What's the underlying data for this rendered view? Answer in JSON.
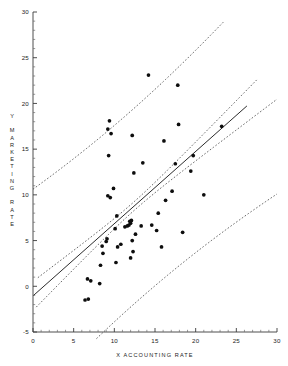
{
  "chart_data": {
    "type": "scatter",
    "title": "",
    "xlabel": "X ACCOUNTING RATE",
    "ylabel": "Y MARKETING RATE",
    "xlim": [
      0,
      30
    ],
    "ylim": [
      -5,
      30
    ],
    "xticks": [
      0,
      5,
      10,
      15,
      20,
      25,
      30
    ],
    "yticks": [
      -5,
      0,
      5,
      10,
      15,
      20,
      25,
      30
    ],
    "xtick_labels": [
      "0",
      "5",
      "10",
      "15",
      "20",
      "25",
      "30"
    ],
    "ytick_labels": [
      "-5",
      "0",
      "5",
      "10",
      "15",
      "20",
      "25",
      "30"
    ],
    "grid": false,
    "legend": "none",
    "minor_ticks": true,
    "points": [
      [
        6.4,
        -1.5
      ],
      [
        6.8,
        -1.4
      ],
      [
        6.7,
        0.8
      ],
      [
        7.1,
        0.6
      ],
      [
        8.2,
        0.3
      ],
      [
        8.3,
        2.3
      ],
      [
        8.6,
        3.6
      ],
      [
        8.5,
        4.4
      ],
      [
        9.0,
        4.9
      ],
      [
        9.1,
        5.2
      ],
      [
        9.2,
        9.9
      ],
      [
        9.5,
        9.7
      ],
      [
        9.3,
        14.3
      ],
      [
        9.2,
        17.2
      ],
      [
        9.4,
        18.1
      ],
      [
        9.6,
        16.7
      ],
      [
        9.9,
        10.7
      ],
      [
        10.1,
        6.3
      ],
      [
        10.3,
        7.7
      ],
      [
        10.2,
        2.6
      ],
      [
        10.4,
        4.3
      ],
      [
        10.8,
        4.6
      ],
      [
        11.3,
        6.5
      ],
      [
        11.6,
        6.6
      ],
      [
        11.8,
        6.7
      ],
      [
        11.9,
        7.1
      ],
      [
        12.0,
        6.9
      ],
      [
        12.1,
        7.2
      ],
      [
        12.2,
        5.0
      ],
      [
        12.3,
        3.8
      ],
      [
        12.0,
        3.1
      ],
      [
        12.4,
        12.4
      ],
      [
        12.2,
        16.5
      ],
      [
        12.6,
        5.7
      ],
      [
        13.3,
        6.6
      ],
      [
        13.5,
        13.5
      ],
      [
        14.2,
        23.1
      ],
      [
        14.6,
        6.7
      ],
      [
        15.2,
        6.1
      ],
      [
        15.4,
        8.0
      ],
      [
        15.8,
        4.3
      ],
      [
        16.1,
        15.9
      ],
      [
        16.3,
        9.4
      ],
      [
        17.1,
        10.4
      ],
      [
        17.5,
        13.4
      ],
      [
        17.9,
        17.7
      ],
      [
        17.8,
        22.0
      ],
      [
        18.4,
        5.9
      ],
      [
        19.4,
        12.6
      ],
      [
        19.7,
        14.3
      ],
      [
        21.0,
        10.0
      ],
      [
        23.2,
        17.5
      ]
    ],
    "fit": {
      "kind": "linear-regression",
      "intercept": -1.05,
      "slope": 0.79
    },
    "bands": [
      {
        "kind": "confidence-band-upper"
      },
      {
        "kind": "confidence-band-lower"
      },
      {
        "kind": "prediction-band-upper"
      },
      {
        "kind": "prediction-band-lower"
      }
    ]
  },
  "axes": {
    "x_title": "X ACCOUNTING RATE",
    "y_title": "Y MARKETING RATE"
  }
}
